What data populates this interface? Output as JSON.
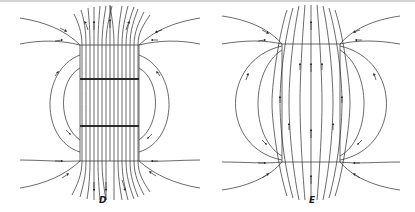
{
  "panels": [
    {
      "id": "D",
      "label": "D",
      "description": "Field lines through a uniformly magnetized bar (B field), lines crowd through the body and spread outside"
    },
    {
      "id": "E",
      "label": "E",
      "description": "Field lines through a body, bowing outward inside and looping around the sides"
    }
  ],
  "colors": {
    "line": "#2a2a2a",
    "background": "#ffffff",
    "border": "#d4d4d4"
  }
}
